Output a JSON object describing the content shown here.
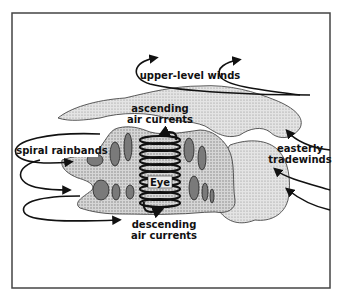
{
  "diagram": {
    "labels": {
      "upper_level_winds": "upper-level winds",
      "ascending_line1": "ascending",
      "ascending_line2": "air currents",
      "spiral_rainbands": "spiral rainbands",
      "easterly_line1": "easterly",
      "easterly_line2": "tradewinds",
      "eye": "Eye",
      "descending_line1": "descending",
      "descending_line2": "air currents"
    },
    "colors": {
      "frame": "#444444",
      "cloud_light": "#e2e2e2",
      "cloud_dots": "#9a9a9a",
      "rainband_cell": "#7a7a7a",
      "ink": "#111111",
      "background": "#ffffff"
    }
  }
}
